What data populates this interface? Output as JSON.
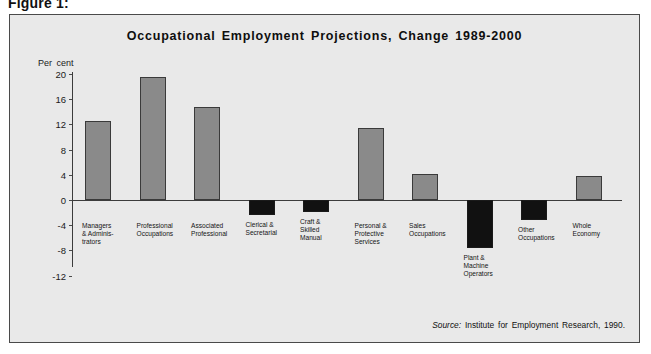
{
  "figure": {
    "caption": "Figure 1:"
  },
  "source": {
    "keyword": "Source:",
    "text": "Institute for Employment Research, 1990."
  },
  "colors": {
    "panel_background": "#e9e9e9",
    "panel_border": "#4a4a4a",
    "bar_gray": "#8a8a8a",
    "bar_black": "#111111",
    "axis": "#3c3c3c",
    "text": "#111111"
  },
  "chart_data": {
    "type": "bar",
    "title": "Occupational Employment Projections, Change 1989-2000",
    "xlabel": "",
    "ylabel": "Per cent",
    "ylim": [
      -12,
      20
    ],
    "yticks": [
      20,
      16,
      12,
      8,
      4,
      0,
      -4,
      -8,
      -12
    ],
    "grid": false,
    "legend": "none",
    "categories": [
      "Managers\n& Adminis-\ntrators",
      "Professional\nOccupations",
      "Associated\nProfessional",
      "Clerical &\nSecretarial",
      "Craft &\nSkilled\nManual",
      "Personal &\nProtective\nServices",
      "Sales\nOccupations",
      "Plant &\nMachine\nOperators",
      "Other\nOccupations",
      "Whole\nEconomy"
    ],
    "values": [
      12.5,
      19.5,
      14.8,
      -2.4,
      -1.9,
      11.4,
      4.1,
      -7.6,
      -3.2,
      3.8
    ],
    "bar_colors": [
      "#8a8a8a",
      "#8a8a8a",
      "#8a8a8a",
      "#111111",
      "#111111",
      "#8a8a8a",
      "#8a8a8a",
      "#111111",
      "#111111",
      "#8a8a8a"
    ]
  }
}
